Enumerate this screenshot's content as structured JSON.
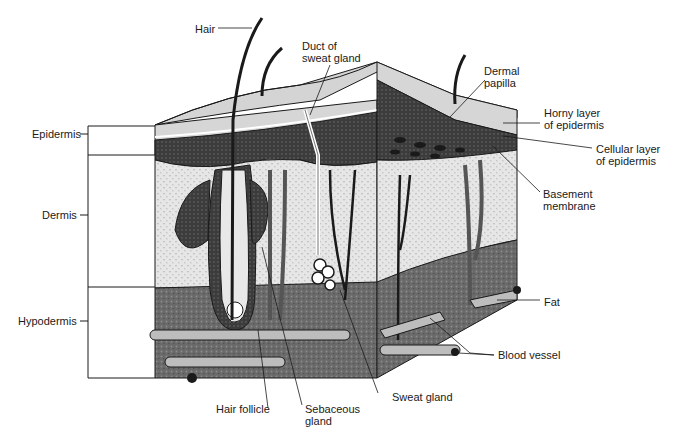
{
  "diagram": {
    "left_labels": {
      "epidermis": "Epidermis",
      "dermis": "Dermis",
      "hypodermis": "Hypodermis"
    },
    "callouts": {
      "hair": "Hair",
      "duct_of_sweat_gland": "Duct of\nsweat gland",
      "dermal_papilla": "Dermal\npapilla",
      "horny_layer": "Horny layer\nof epidermis",
      "cellular_layer": "Cellular layer\nof epidermis",
      "basement_membrane": "Basement\nmembrane",
      "fat": "Fat",
      "blood_vessel": "Blood vessel",
      "hair_follicle": "Hair follicle",
      "sebaceous_gland": "Sebaceous\ngland",
      "sweat_gland": "Sweat gland"
    },
    "colors": {
      "ink": "#1a1a1a",
      "epidermis_surface": "#d6d6d6",
      "cellular_layer": "#3a3a3a",
      "dermis": "#e4e4e4",
      "hypodermis": "#6e6e6e",
      "vessel": "#bdbdbd"
    }
  }
}
